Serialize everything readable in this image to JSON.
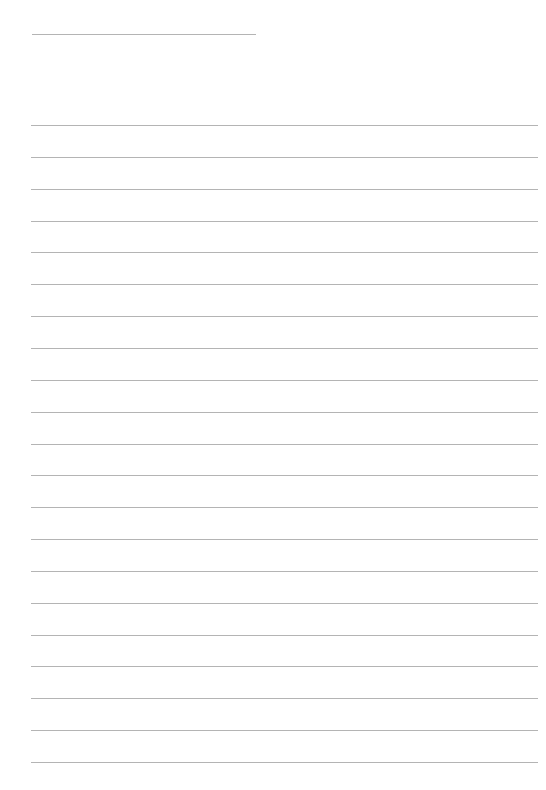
{
  "page": {
    "type": "lined-paper",
    "line_color": "#b4b4b4",
    "background": "#ffffff",
    "header_line": {
      "x": 32,
      "y": 34,
      "width": 224
    },
    "ruled_lines": {
      "count": 21,
      "x": 31,
      "width": 507,
      "first_y": 125,
      "spacing": 31.85
    }
  }
}
